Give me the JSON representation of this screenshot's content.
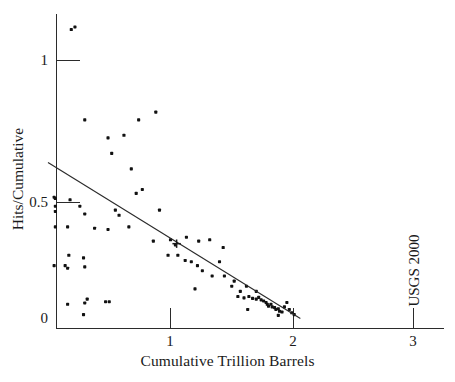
{
  "chart_data": {
    "type": "scatter",
    "title": "",
    "xlabel": "Cumulative Trillion Barrels",
    "ylabel": "Hits/Cumulative",
    "xlim": [
      0,
      3.25
    ],
    "ylim": [
      0,
      1.16
    ],
    "grid": false,
    "legend": null,
    "xticks": [
      1,
      2,
      3
    ],
    "xtick_labels": [
      "1",
      "2",
      "3"
    ],
    "yticks": [
      0,
      0.5,
      1
    ],
    "ytick_labels": [
      "0",
      "0.5",
      "1"
    ],
    "annotations": [
      {
        "text": "USGS 2000",
        "x": 2.98,
        "y": 0.28,
        "rotation": 90
      }
    ],
    "series": [
      {
        "name": "Hits/Cumulative",
        "type": "scatter",
        "marker": "filled-square-dot",
        "color": "#111111",
        "points": [
          [
            0.19,
            1.12
          ],
          [
            0.22,
            1.13
          ],
          [
            0.88,
            0.8
          ],
          [
            0.74,
            0.77
          ],
          [
            0.3,
            0.77
          ],
          [
            0.49,
            0.7
          ],
          [
            0.62,
            0.71
          ],
          [
            0.52,
            0.64
          ],
          [
            0.68,
            0.58
          ],
          [
            0.77,
            0.5
          ],
          [
            0.72,
            0.485
          ],
          [
            0.05,
            0.47
          ],
          [
            0.06,
            0.465
          ],
          [
            0.18,
            0.46
          ],
          [
            0.06,
            0.435
          ],
          [
            0.26,
            0.435
          ],
          [
            0.55,
            0.42
          ],
          [
            0.06,
            0.415
          ],
          [
            0.3,
            0.405
          ],
          [
            0.58,
            0.4
          ],
          [
            0.91,
            0.42
          ],
          [
            0.06,
            0.355
          ],
          [
            0.16,
            0.355
          ],
          [
            0.38,
            0.35
          ],
          [
            0.49,
            0.345
          ],
          [
            0.66,
            0.355
          ],
          [
            0.86,
            0.3
          ],
          [
            1.0,
            0.305
          ],
          [
            1.13,
            0.315
          ],
          [
            1.23,
            0.3
          ],
          [
            1.32,
            0.305
          ],
          [
            1.04,
            0.285
          ],
          [
            1.43,
            0.275
          ],
          [
            0.17,
            0.245
          ],
          [
            0.29,
            0.235
          ],
          [
            0.05,
            0.205
          ],
          [
            0.14,
            0.205
          ],
          [
            0.16,
            0.195
          ],
          [
            0.3,
            0.2
          ],
          [
            1.12,
            0.225
          ],
          [
            1.22,
            0.205
          ],
          [
            1.4,
            0.22
          ],
          [
            0.98,
            0.245
          ],
          [
            1.06,
            0.245
          ],
          [
            1.17,
            0.22
          ],
          [
            1.26,
            0.185
          ],
          [
            1.34,
            0.165
          ],
          [
            1.2,
            0.115
          ],
          [
            1.5,
            0.125
          ],
          [
            1.57,
            0.105
          ],
          [
            1.62,
            0.125
          ],
          [
            0.16,
            0.055
          ],
          [
            0.3,
            0.06
          ],
          [
            0.32,
            0.075
          ],
          [
            0.29,
            0.015
          ],
          [
            0.47,
            0.065
          ],
          [
            0.5,
            0.065
          ],
          [
            1.44,
            0.165
          ],
          [
            1.52,
            0.145
          ],
          [
            1.55,
            0.085
          ],
          [
            1.6,
            0.08
          ],
          [
            1.64,
            0.085
          ],
          [
            1.67,
            0.078
          ],
          [
            1.7,
            0.075
          ],
          [
            1.72,
            0.082
          ],
          [
            1.74,
            0.072
          ],
          [
            1.76,
            0.068
          ],
          [
            1.63,
            0.035
          ],
          [
            1.78,
            0.062
          ],
          [
            1.79,
            0.055
          ],
          [
            1.8,
            0.048
          ],
          [
            1.82,
            0.055
          ],
          [
            1.83,
            0.045
          ],
          [
            1.85,
            0.042
          ],
          [
            1.86,
            0.035
          ],
          [
            1.88,
            0.038
          ],
          [
            1.89,
            0.028
          ],
          [
            1.91,
            0.025
          ],
          [
            1.93,
            0.045
          ],
          [
            1.95,
            0.062
          ],
          [
            1.97,
            0.035
          ],
          [
            1.99,
            0.022
          ],
          [
            2.01,
            0.015
          ],
          [
            1.88,
            0.012
          ],
          [
            1.7,
            0.105
          ]
        ]
      },
      {
        "name": "Linear trend",
        "type": "line",
        "color": "#2b2b2b",
        "x": [
          0.0,
          2.06
        ],
        "y": [
          0.605,
          0.0
        ]
      },
      {
        "name": "Midpoint marker",
        "type": "cross-marker",
        "x": 1.05,
        "y": 0.29
      }
    ]
  },
  "axes": {
    "x_title": "Cumulative Trillion Barrels",
    "y_title": "Hits/Cumulative",
    "x_tick_labels": [
      "1",
      "2",
      "3"
    ],
    "y_tick_labels": [
      "0",
      "0.5",
      "1"
    ]
  },
  "annotation": {
    "usgs_label": "USGS 2000"
  },
  "colors": {
    "axis": "#2b2b2b",
    "marker": "#111111",
    "line": "#2b2b2b",
    "background": "#ffffff"
  }
}
